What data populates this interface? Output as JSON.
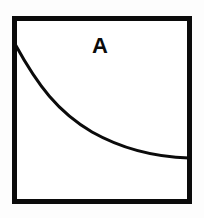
{
  "figure": {
    "background_color": "#fdfdfd",
    "ink_color": "#0b0b0b",
    "panel": {
      "label": "A",
      "label_x": 100,
      "label_y": 53,
      "label_font_size": 22,
      "fill_color": "#ffffff",
      "border_color": "#0b0b0b",
      "border_width": 5,
      "x": 14.5,
      "y": 18.5,
      "width": 175,
      "height": 183
    },
    "curve": {
      "name": "decay-curve",
      "stroke_color": "#0b0b0b",
      "stroke_width": 3,
      "path": "M 15 44 C 38 86, 58 112, 92 132 C 124 150, 155 157, 189 158"
    }
  },
  "chart_data": {
    "type": "line",
    "title": "A",
    "xlabel": "",
    "ylabel": "",
    "grid": false,
    "legend": "none",
    "axis_ticks": [],
    "xlim": [
      0,
      1
    ],
    "ylim": [
      0,
      1
    ],
    "series": [
      {
        "name": "A",
        "description": "monotonically decreasing decaying curve from upper-left to lower-right",
        "x": [
          0.0,
          0.1,
          0.2,
          0.3,
          0.4,
          0.5,
          0.6,
          0.7,
          0.8,
          0.9,
          1.0
        ],
        "y": [
          0.87,
          0.7,
          0.58,
          0.49,
          0.42,
          0.36,
          0.31,
          0.28,
          0.26,
          0.25,
          0.24
        ]
      }
    ]
  }
}
